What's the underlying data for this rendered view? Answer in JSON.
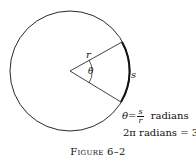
{
  "diagram": {
    "circle": {
      "cx": 70,
      "cy": 71,
      "r": 60
    },
    "labels": {
      "radius": "r",
      "angle": "θ",
      "arc": "s"
    },
    "formula1": {
      "lhs": "θ",
      "eq": "=",
      "num": "s",
      "den": "r",
      "unit": "radians"
    },
    "formula2": "2π radians = 360°",
    "caption": "Figure 6–2"
  }
}
